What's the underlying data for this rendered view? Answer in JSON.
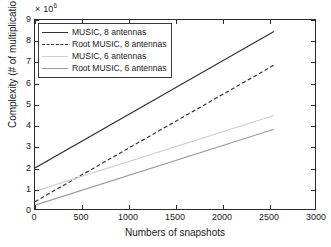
{
  "chart": {
    "type": "line",
    "exponent_prefix": "× 10",
    "exponent_power": "6",
    "xlabel": "Numbers of snapshots",
    "ylabel": "Complexity (# of multiplications)",
    "title": ""
  },
  "axes": {
    "xlim": [
      0,
      3000
    ],
    "ylim": [
      0,
      9
    ],
    "xticks": [
      0,
      500,
      1000,
      1500,
      2000,
      2500,
      3000
    ],
    "xticklabels": [
      "0",
      "500",
      "1000",
      "1500",
      "2000",
      "2500",
      "3000"
    ],
    "yticks": [
      0,
      1,
      2,
      3,
      4,
      5,
      6,
      7,
      8,
      9
    ],
    "yticklabels": [
      "0",
      "1",
      "2",
      "3",
      "4",
      "5",
      "6",
      "7",
      "8",
      "9"
    ],
    "grid": "off",
    "box": "on"
  },
  "legend": {
    "position": "top-left",
    "entries": [
      {
        "label": "MUSIC, 8 antennas",
        "color": "#333333",
        "style": "solid",
        "width": 1.2
      },
      {
        "label": "Root MUSIC, 8 antennas",
        "color": "#333333",
        "style": "dashed",
        "width": 1.2
      },
      {
        "label": "MUSIC, 6 antennas",
        "color": "#cfcfcf",
        "style": "solid",
        "width": 1.2
      },
      {
        "label": "Root MUSIC, 6 antennas",
        "color": "#9a9a9a",
        "style": "solid",
        "width": 1.2
      }
    ]
  },
  "chart_data": {
    "type": "line",
    "title": "",
    "xlabel": "Numbers of snapshots",
    "ylabel": "Complexity (# of multiplications)",
    "y_exponent": 1000000,
    "y_exponent_label": "× 10^6",
    "xlim": [
      0,
      3000
    ],
    "ylim": [
      0,
      9
    ],
    "xticks": [
      0,
      500,
      1000,
      1500,
      2000,
      2500,
      3000
    ],
    "yticks": [
      0,
      1,
      2,
      3,
      4,
      5,
      6,
      7,
      8,
      9
    ],
    "grid": "off",
    "legend_position": "upper left",
    "x": [
      0,
      2560
    ],
    "series": [
      {
        "name": "MUSIC, 8 antennas",
        "color": "#333333",
        "style": "solid",
        "x": [
          0,
          2560
        ],
        "values": [
          1.95,
          8.45
        ]
      },
      {
        "name": "Root MUSIC, 8 antennas",
        "color": "#333333",
        "style": "dashed",
        "x": [
          0,
          2560
        ],
        "values": [
          0.35,
          6.85
        ]
      },
      {
        "name": "MUSIC, 6 antennas",
        "color": "#cfcfcf",
        "style": "solid",
        "x": [
          0,
          2560
        ],
        "values": [
          0.85,
          4.45
        ]
      },
      {
        "name": "Root MUSIC, 6 antennas",
        "color": "#9a9a9a",
        "style": "solid",
        "x": [
          0,
          2560
        ],
        "values": [
          0.18,
          3.8
        ]
      }
    ]
  }
}
